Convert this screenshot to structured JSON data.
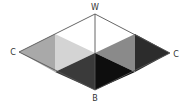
{
  "diagram": {
    "title": "",
    "labels": {
      "top": "W",
      "bottom": "B",
      "left": "C",
      "right": "C"
    },
    "colors": {
      "outline": "#555555",
      "left_outer": "#a9a9a9",
      "left_upper": "#ffffff",
      "left_middle": "#d4d4d4",
      "left_lower": "#3a3a3a",
      "right_upper": "#ffffff",
      "right_middle": "#8a8a8a",
      "right_lower": "#0e0e0e",
      "right_outer": "#2c2c2c"
    }
  }
}
